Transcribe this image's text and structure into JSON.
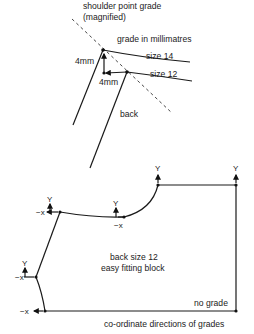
{
  "inset": {
    "title_line1": "shoulder point grade",
    "title_line2": "(magnified)",
    "subtitle": "grade in millimatres",
    "size_large_label": "size 14",
    "size_small_label": "size 12",
    "vertical_grade_label": "4mm",
    "horizontal_grade_label": "4mm",
    "piece_label": "back"
  },
  "block": {
    "title_line1": "back size 12",
    "title_line2": "easy fitting block",
    "no_grade_label": "no grade",
    "caption": "co-ordinate directions of grades",
    "axis_y_label": "Y",
    "axis_negx_label": "−x"
  },
  "colors": {
    "line": "#1a1a1a",
    "text": "#222222",
    "background": "#ffffff"
  }
}
